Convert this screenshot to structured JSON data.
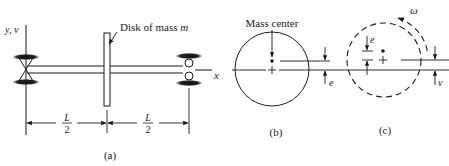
{
  "figure_a": {
    "axis_label_yv": "y, v",
    "axis_label_x": "x",
    "disk_label_prefix": "Disk of mass ",
    "disk_label_var": "m",
    "dim_left_num": "L",
    "dim_left_den": "2",
    "dim_right_num": "L",
    "dim_right_den": "2",
    "caption": "(a)"
  },
  "figure_b": {
    "mass_center_label": "Mass center",
    "offset_label": "e",
    "caption": "(b)"
  },
  "figure_c": {
    "omega_label": "ω",
    "offset_label": "e",
    "deflection_label": "v",
    "caption": "(c)"
  },
  "colors": {
    "ink": "#1a1a1a",
    "background": "#ffffff"
  }
}
